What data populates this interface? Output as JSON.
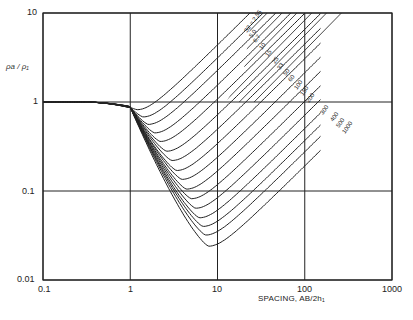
{
  "chart_data": {
    "type": "line",
    "title": "",
    "xlabel": "SPACING, AB/2h1",
    "ylabel": "ρa/ρ1",
    "xscale": "log",
    "yscale": "log",
    "xlim": [
      0.1,
      1000
    ],
    "ylim": [
      0.01,
      10
    ],
    "x_ticks": [
      "0.1",
      "1",
      "10",
      "100",
      "1000"
    ],
    "y_ticks": [
      "0.01",
      "0.1",
      "1",
      "10"
    ],
    "grid": true,
    "hatched_region": "asymptote zone above/right of diagonal, upper-right",
    "curve_label_prefix": "S2 =",
    "series": [
      {
        "name": "2.55",
        "min_x": 1.2,
        "min_y": 0.82
      },
      {
        "name": "5.0",
        "min_x": 1.4,
        "min_y": 0.68
      },
      {
        "name": "6.7",
        "min_x": 1.6,
        "min_y": 0.56
      },
      {
        "name": "10",
        "min_x": 1.9,
        "min_y": 0.45
      },
      {
        "name": "15",
        "min_x": 2.2,
        "min_y": 0.36
      },
      {
        "name": "25",
        "min_x": 2.6,
        "min_y": 0.28
      },
      {
        "name": "33",
        "min_x": 3.0,
        "min_y": 0.22
      },
      {
        "name": "50",
        "min_x": 3.4,
        "min_y": 0.17
      },
      {
        "name": "60",
        "min_x": 3.9,
        "min_y": 0.135
      },
      {
        "name": "100",
        "min_x": 4.4,
        "min_y": 0.105
      },
      {
        "name": "150",
        "min_x": 5.0,
        "min_y": 0.082
      },
      {
        "name": "200",
        "min_x": 5.6,
        "min_y": 0.064
      },
      {
        "name": "300",
        "min_x": 6.2,
        "min_y": 0.05
      },
      {
        "name": "400",
        "min_x": 6.8,
        "min_y": 0.04
      },
      {
        "name": "500",
        "min_x": 7.3,
        "min_y": 0.032
      },
      {
        "name": "1000",
        "min_x": 7.9,
        "min_y": 0.024
      }
    ],
    "caption": "Fig. (illegible caption)"
  },
  "labels": {
    "x_ticks": [
      "0.1",
      "1",
      "10",
      "100",
      "1000"
    ],
    "y_ticks": [
      "10",
      "1",
      "0.1",
      "0.01"
    ],
    "xlabel": "SPACING,  AB/2h₁",
    "ylabel": "ρa / ρ₁"
  }
}
